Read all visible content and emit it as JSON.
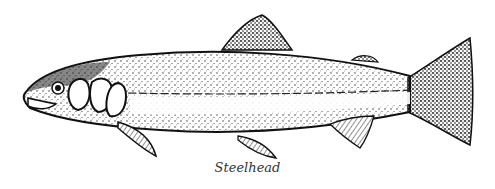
{
  "illustration": {
    "subject": "fish-illustration",
    "style": "black ink stipple drawing",
    "caption": "Steelhead",
    "colors": {
      "ink": "#111111",
      "background": "#ffffff",
      "caption": "#333333"
    }
  }
}
